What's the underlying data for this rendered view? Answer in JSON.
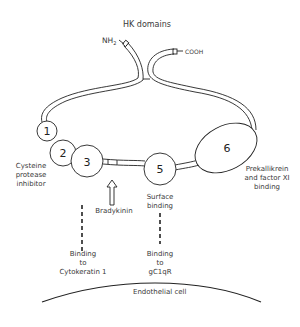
{
  "title": "HK domains",
  "termini": {
    "n_terminus": "NH",
    "n_terminus_sub": "2",
    "c_terminus": "COOH"
  },
  "domains": [
    {
      "number": "1"
    },
    {
      "number": "2"
    },
    {
      "number": "3"
    },
    {
      "number": "5"
    },
    {
      "number": "6"
    }
  ],
  "labels": {
    "cysteine": [
      "Cysteine",
      "protease",
      "inhibitor"
    ],
    "bradykinin": "Bradykinin",
    "surface": [
      "Surface",
      "binding"
    ],
    "prekallikrein": [
      "Prekallikrein",
      "and factor XI",
      "binding"
    ],
    "cytokeratin": [
      "Binding",
      "to",
      "Cytokeratin 1"
    ],
    "gc1qr": [
      "Binding",
      "to",
      "gC1qR"
    ],
    "endothelial": "Endothelial cell"
  },
  "colors": {
    "line": "#222222",
    "text": "#3a3a3a",
    "background": "#ffffff"
  }
}
